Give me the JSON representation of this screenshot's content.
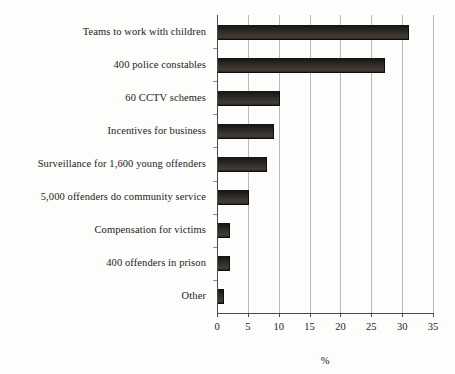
{
  "chart_data": {
    "type": "bar",
    "orientation": "horizontal",
    "title": "",
    "xlabel": "%",
    "ylabel": "",
    "xlim": [
      0,
      35
    ],
    "xticks": [
      0,
      5,
      10,
      15,
      20,
      25,
      30,
      35
    ],
    "grid": true,
    "legend": false,
    "bar_color": "#2b2622",
    "axis_color": "#4a4a4a",
    "grid_color": "#b9b9b9",
    "background": "#fdfdfc",
    "categories": [
      "Teams to work with children",
      "400 police constables",
      "60 CCTV schemes",
      "Incentives for business",
      "Surveillance for 1,600 young offenders",
      "5,000 offenders do community service",
      "Compensation for victims",
      "400 offenders in prison",
      "Other"
    ],
    "values": [
      31,
      27,
      10,
      9,
      8,
      5,
      2,
      2,
      1
    ]
  }
}
